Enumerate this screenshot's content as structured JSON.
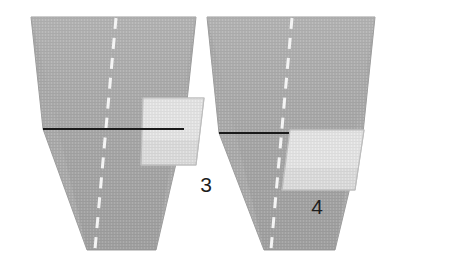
{
  "scene": {
    "title": "Two angled panel surfaces with marked sub-regions",
    "width": 452,
    "height": 268,
    "background_color": "#ffffff",
    "panel_count": 2
  },
  "colors": {
    "background": "#ffffff",
    "panel_fill": "#a9a9a9",
    "panel_fill_light": "#b4b4b4",
    "panel_edge": "#9a9a9a",
    "patch_fill": "#d9d9d9",
    "patch_fill_bright": "#e3e3e3",
    "patch_edge": "#bdbdbd",
    "dark_line": "#1a1a1a",
    "dashed_line": "#f2f2f2",
    "label_color": "#1d1d1d",
    "stripe_color": "#b9b9b9"
  },
  "panels": [
    {
      "id": "panel-left",
      "label": "3",
      "label_x": 206,
      "label_y": 192,
      "outline_points": "31,17 196,17 156,250 87,250",
      "upper_points": "31,17 196,17 184,129 43,129",
      "lower_points": "43,129 184,129 156,250 87,250",
      "dark_line": {
        "x1": 43,
        "y1": 129,
        "x2": 184,
        "y2": 129
      },
      "dashed_line": {
        "x1": 116,
        "y1": 17,
        "x2": 95,
        "y2": 250
      },
      "patch_points": "143,98 204,98 196,165 141,165",
      "patch_highlight_points": "143,98 204,98 199,140 142,140"
    },
    {
      "id": "panel-right",
      "label": "4",
      "label_x": 317,
      "label_y": 214,
      "outline_points": "207,17 375,17 335,250 264,250",
      "upper_points": "207,17 375,17 363,133 219,133",
      "lower_points": "219,133 363,133 335,250 264,250",
      "dark_line": {
        "x1": 219,
        "y1": 133,
        "x2": 363,
        "y2": 133
      },
      "dashed_line": {
        "x1": 292,
        "y1": 17,
        "x2": 271,
        "y2": 250
      },
      "patch_points": "290,130 364,130 355,190 282,190",
      "patch_highlight_points": "290,130 364,130 358,168 285,168"
    }
  ],
  "annotations": {
    "label_3": "3",
    "label_4": "4"
  },
  "dash_pattern": {
    "dash": 11,
    "gap": 9,
    "stroke_width": 3
  }
}
